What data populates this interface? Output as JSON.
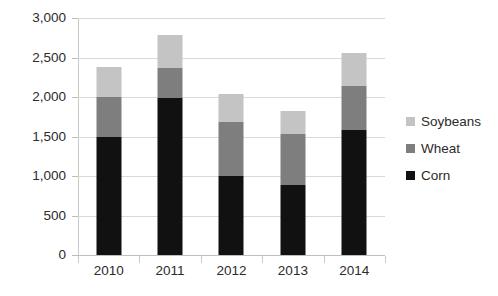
{
  "chart_data": {
    "type": "bar",
    "subtype": "stacked-column",
    "title": "",
    "xlabel": "",
    "ylabel": "",
    "categories": [
      "2010",
      "2011",
      "2012",
      "2013",
      "2014"
    ],
    "series": [
      {
        "name": "Corn",
        "color": "#111111",
        "values": [
          1500,
          1990,
          1000,
          880,
          1580
        ]
      },
      {
        "name": "Wheat",
        "color": "#7e7e7e",
        "values": [
          500,
          380,
          680,
          650,
          560
        ]
      },
      {
        "name": "Soybeans",
        "color": "#c4c4c4",
        "values": [
          380,
          410,
          360,
          290,
          420
        ]
      }
    ],
    "totals": [
      2380,
      2780,
      2040,
      1820,
      2560
    ],
    "ylim": [
      0,
      3000
    ],
    "ytick_values": [
      0,
      500,
      1000,
      1500,
      2000,
      2500,
      3000
    ],
    "ytick_labels": [
      "0",
      "500",
      "1,000",
      "1,500",
      "2,000",
      "2,500",
      "3,000"
    ],
    "grid": true,
    "legend_position": "right",
    "legend_order": [
      "Soybeans",
      "Wheat",
      "Corn"
    ]
  },
  "axes": {
    "y_ticks": [
      {
        "label": "3,000",
        "value": 3000
      },
      {
        "label": "2,500",
        "value": 2500
      },
      {
        "label": "2,000",
        "value": 2000
      },
      {
        "label": "1,500",
        "value": 1500
      },
      {
        "label": "1,000",
        "value": 1000
      },
      {
        "label": "500",
        "value": 500
      },
      {
        "label": "0",
        "value": 0
      }
    ],
    "x_labels": [
      "2010",
      "2011",
      "2012",
      "2013",
      "2014"
    ]
  },
  "legend": {
    "items": [
      {
        "label": "Soybeans",
        "color": "#c4c4c4"
      },
      {
        "label": "Wheat",
        "color": "#7e7e7e"
      },
      {
        "label": "Corn",
        "color": "#111111"
      }
    ]
  }
}
